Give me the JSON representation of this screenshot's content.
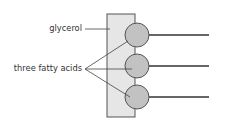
{
  "diagram": {
    "labels": {
      "glycerol": "glycerol",
      "fatty_acids": "three fatty acids"
    },
    "colors": {
      "glycerol_fill": "#e6e6e6",
      "head_fill": "#c2c2c2",
      "stroke": "#444444"
    },
    "components": {
      "glycerol_backbone": 1,
      "fatty_acid_heads": 3,
      "fatty_acid_tails": 3
    }
  }
}
